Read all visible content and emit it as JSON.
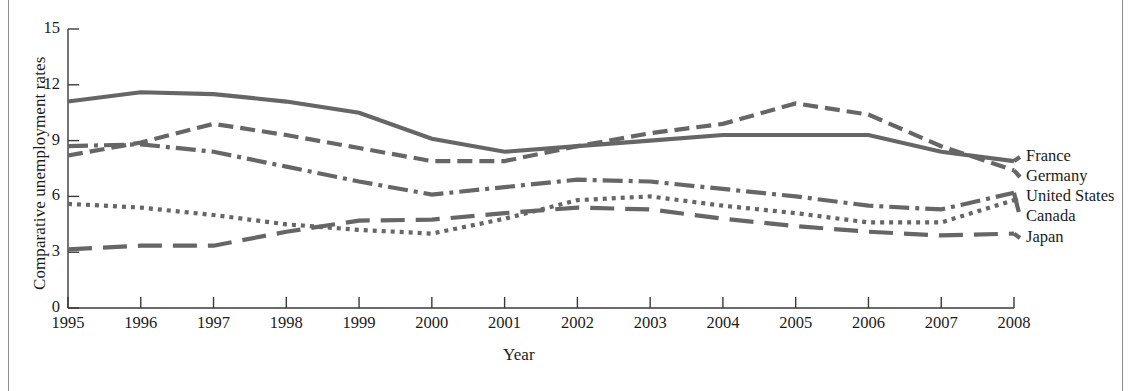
{
  "figure": {
    "axis_x_title": "Year",
    "axis_y_title": "Comparative unemployment rates",
    "line_color": "#666666",
    "text_color": "#1b1b1b",
    "rule_color": "#8d8d8d"
  },
  "chart_data": {
    "type": "line",
    "title": "",
    "xlabel": "Year",
    "ylabel": "Comparative unemployment rates",
    "xlim": [
      1995,
      2008
    ],
    "ylim": [
      0,
      15
    ],
    "yticks": [
      0,
      3,
      6,
      9,
      12,
      15
    ],
    "grid": false,
    "legend_position": "right-outside",
    "x": [
      1995,
      1996,
      1997,
      1998,
      1999,
      2000,
      2001,
      2002,
      2003,
      2004,
      2005,
      2006,
      2007,
      2008
    ],
    "series": [
      {
        "name": "France",
        "style": "solid",
        "values": [
          11.1,
          11.6,
          11.5,
          11.1,
          10.5,
          9.1,
          8.4,
          8.7,
          9.0,
          9.3,
          9.3,
          9.3,
          8.4,
          7.9
        ]
      },
      {
        "name": "Germany",
        "style": "dashed",
        "values": [
          8.2,
          8.9,
          9.9,
          9.3,
          8.6,
          7.9,
          7.9,
          8.7,
          9.4,
          9.9,
          11.0,
          10.4,
          8.7,
          7.4
        ]
      },
      {
        "name": "United States",
        "style": "dotted",
        "values": [
          5.6,
          5.4,
          5.0,
          4.5,
          4.2,
          4.0,
          4.8,
          5.8,
          6.0,
          5.5,
          5.1,
          4.6,
          4.6,
          5.8
        ]
      },
      {
        "name": "Canada",
        "style": "dash-dot",
        "values": [
          8.7,
          8.8,
          8.4,
          7.6,
          6.8,
          6.1,
          6.5,
          6.9,
          6.8,
          6.4,
          6.0,
          5.5,
          5.3,
          6.2
        ]
      },
      {
        "name": "Japan",
        "style": "long-dash",
        "values": [
          3.15,
          3.35,
          3.35,
          4.1,
          4.7,
          4.75,
          5.1,
          5.4,
          5.3,
          4.8,
          4.4,
          4.1,
          3.9,
          4.0
        ]
      }
    ]
  },
  "xticks": [
    "1995",
    "1996",
    "1997",
    "1998",
    "1999",
    "2000",
    "2001",
    "2002",
    "2003",
    "2004",
    "2005",
    "2006",
    "2007",
    "2008"
  ],
  "yticks": [
    "0",
    "3",
    "6",
    "9",
    "12",
    "15"
  ],
  "legend": [
    {
      "label": "France"
    },
    {
      "label": "Germany"
    },
    {
      "label": "United States"
    },
    {
      "label": "Canada"
    },
    {
      "label": "Japan"
    }
  ]
}
